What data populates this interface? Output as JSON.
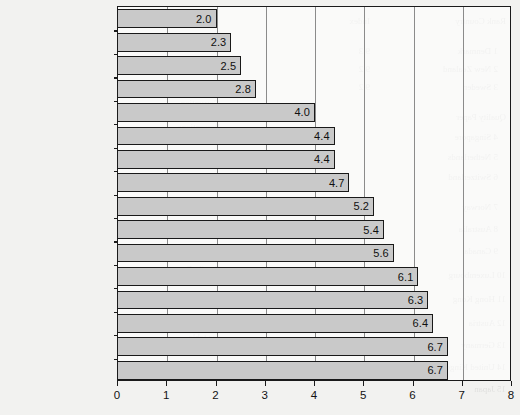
{
  "chart_data": {
    "type": "bar",
    "orientation": "horizontal",
    "title": "",
    "subtitle": "",
    "xlabel": "",
    "ylabel": "",
    "xlim": [
      0,
      8
    ],
    "ylim": null,
    "grid": true,
    "legend": null,
    "legend_position": "none",
    "xticks": [
      "0",
      "1",
      "2",
      "3",
      "4",
      "5",
      "6",
      "7",
      "8"
    ],
    "categories": [
      "El Salvador",
      "South Africa",
      "Kenya",
      "Brazil",
      "Russian Federation",
      "US",
      "China",
      "UK",
      "India",
      "Japan",
      "Australia",
      "United Arab Emirates",
      "Singapore",
      "Germany",
      "Finland",
      "Syria"
    ],
    "values": [
      2.0,
      2.3,
      2.5,
      2.8,
      4.0,
      4.4,
      4.4,
      4.7,
      5.2,
      5.4,
      5.6,
      6.1,
      6.3,
      6.4,
      6.7,
      6.7
    ],
    "data_labels": [
      "2.0",
      "2.3",
      "2.5",
      "2.8",
      "4.0",
      "4.4",
      "4.4",
      "4.7",
      "5.2",
      "5.4",
      "5.6",
      "6.1",
      "6.3",
      "6.4",
      "6.7",
      "6.7"
    ],
    "annotations": []
  },
  "style": {
    "bar_fill": "#c9c9c9",
    "bar_stroke": "#191919",
    "gridline_color": "#8b8b8b",
    "axis_color": "#1b1b1b",
    "text_color": "#131313",
    "page_background": "#f2f2f0"
  }
}
